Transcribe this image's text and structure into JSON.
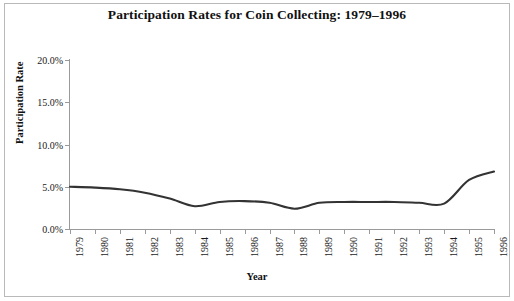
{
  "chart_data": {
    "type": "line",
    "title": "Participation Rates for Coin Collecting: 1979–1996",
    "xlabel": "Year",
    "ylabel": "Participation Rate",
    "categories": [
      "1979",
      "1980",
      "1981",
      "1982",
      "1983",
      "1984",
      "1985",
      "1986",
      "1987",
      "1988",
      "1989",
      "1990",
      "1991",
      "1992",
      "1993",
      "1994",
      "1995",
      "1996"
    ],
    "x": [
      1979,
      1980,
      1981,
      1982,
      1983,
      1984,
      1985,
      1986,
      1987,
      1988,
      1989,
      1990,
      1991,
      1992,
      1993,
      1994,
      1995,
      1996
    ],
    "values": [
      5.0,
      4.9,
      4.7,
      4.3,
      3.6,
      2.7,
      3.2,
      3.3,
      3.1,
      2.4,
      3.1,
      3.2,
      3.2,
      3.2,
      3.1,
      3.0,
      5.8,
      6.8
    ],
    "series": [
      {
        "name": "Participation Rate",
        "values": [
          5.0,
          4.9,
          4.7,
          4.3,
          3.6,
          2.7,
          3.2,
          3.3,
          3.1,
          2.4,
          3.1,
          3.2,
          3.2,
          3.2,
          3.1,
          3.0,
          5.8,
          6.8
        ]
      }
    ],
    "ylim": [
      0,
      20
    ],
    "xlim": [
      1979,
      1996
    ],
    "y_ticks": [
      0,
      5,
      10,
      15,
      20
    ],
    "y_tick_labels": [
      "0.0%",
      "5.0%",
      "10.0%",
      "15.0%",
      "20.0%"
    ],
    "y_unit": "%",
    "grid": false,
    "legend": false,
    "legend_position": "none",
    "line_color": "#333333",
    "axis_color": "#9a9a9a",
    "background_color": "#ffffff",
    "smoothing": "spline"
  }
}
